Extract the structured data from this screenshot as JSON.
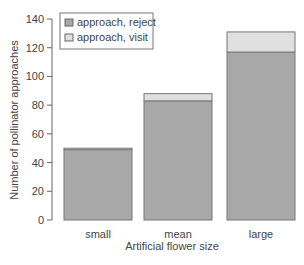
{
  "chart_data": {
    "type": "bar",
    "stacked": true,
    "title": "",
    "xlabel": "Artificial flower size",
    "ylabel": "Number of pollinator approaches",
    "categories": [
      "small",
      "mean",
      "large"
    ],
    "series": [
      {
        "name": "approach, reject",
        "values": [
          49,
          83,
          117
        ],
        "color": "#a8a8a8"
      },
      {
        "name": "approach, visit",
        "values": [
          1,
          5,
          14
        ],
        "color": "#e0e0e0"
      }
    ],
    "ylim": [
      0,
      140
    ],
    "yticks": [
      0,
      20,
      40,
      60,
      80,
      100,
      120,
      140
    ],
    "grid": false,
    "legend_position": "top-left inside"
  }
}
